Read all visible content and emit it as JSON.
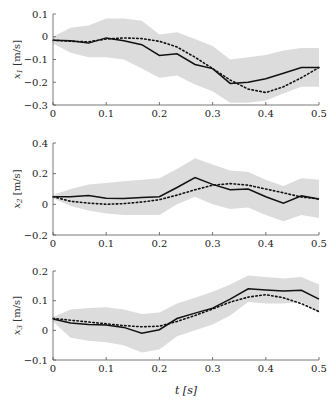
{
  "chart_data": [
    {
      "type": "line",
      "title": "",
      "xlabel": "",
      "ylabel": "x_1 [m/s]",
      "xlim": [
        0,
        0.5
      ],
      "ylim": [
        -0.3,
        0.1
      ],
      "xticks": [
        "0",
        "0.1",
        "0.2",
        "0.3",
        "0.4",
        "0.5"
      ],
      "yticks": [
        "0.1",
        "0",
        "−0.1",
        "−0.2",
        "−0.3"
      ],
      "yticks_values": [
        0.1,
        0,
        -0.1,
        -0.2,
        -0.3
      ],
      "x": [
        0,
        0.033,
        0.067,
        0.1,
        0.133,
        0.167,
        0.2,
        0.233,
        0.267,
        0.3,
        0.333,
        0.367,
        0.4,
        0.433,
        0.467,
        0.5
      ],
      "series": [
        {
          "name": "mean",
          "style": "solid",
          "values": [
            -0.015,
            -0.018,
            -0.028,
            -0.005,
            -0.018,
            -0.035,
            -0.082,
            -0.075,
            -0.122,
            -0.14,
            -0.205,
            -0.2,
            -0.185,
            -0.16,
            -0.135,
            -0.135
          ]
        },
        {
          "name": "reference",
          "style": "dotted",
          "values": [
            -0.015,
            -0.02,
            -0.022,
            -0.01,
            -0.005,
            -0.008,
            -0.02,
            -0.045,
            -0.09,
            -0.14,
            -0.19,
            -0.23,
            -0.245,
            -0.22,
            -0.18,
            -0.135
          ]
        },
        {
          "name": "upper",
          "style": "band",
          "values": [
            0.0,
            0.04,
            0.05,
            0.08,
            0.08,
            0.07,
            0.01,
            0.02,
            -0.01,
            -0.04,
            -0.1,
            -0.09,
            -0.08,
            -0.06,
            -0.05,
            -0.05
          ]
        },
        {
          "name": "lower",
          "style": "band",
          "values": [
            -0.03,
            -0.07,
            -0.09,
            -0.09,
            -0.1,
            -0.14,
            -0.18,
            -0.17,
            -0.21,
            -0.24,
            -0.29,
            -0.29,
            -0.28,
            -0.25,
            -0.22,
            -0.22
          ]
        }
      ],
      "grid": false
    },
    {
      "type": "line",
      "title": "",
      "xlabel": "",
      "ylabel": "x_2 [m/s]",
      "xlim": [
        0,
        0.5
      ],
      "ylim": [
        -0.2,
        0.4
      ],
      "xticks": [
        "0",
        "0.1",
        "0.2",
        "0.3",
        "0.4",
        "0.5"
      ],
      "yticks": [
        "0.4",
        "0.2",
        "0",
        "−0.2"
      ],
      "yticks_values": [
        0.4,
        0.2,
        0,
        -0.2
      ],
      "x": [
        0,
        0.033,
        0.067,
        0.1,
        0.133,
        0.167,
        0.2,
        0.233,
        0.267,
        0.3,
        0.333,
        0.367,
        0.4,
        0.433,
        0.467,
        0.5
      ],
      "series": [
        {
          "name": "mean",
          "style": "solid",
          "values": [
            0.05,
            0.05,
            0.058,
            0.04,
            0.038,
            0.045,
            0.05,
            0.11,
            0.175,
            0.13,
            0.095,
            0.1,
            0.05,
            0.008,
            0.055,
            0.035
          ]
        },
        {
          "name": "reference",
          "style": "dotted",
          "values": [
            0.05,
            0.02,
            0.008,
            0.0,
            0.005,
            0.015,
            0.03,
            0.06,
            0.095,
            0.125,
            0.135,
            0.125,
            0.1,
            0.075,
            0.048,
            0.035
          ]
        },
        {
          "name": "upper",
          "style": "band",
          "values": [
            0.06,
            0.1,
            0.13,
            0.14,
            0.15,
            0.16,
            0.17,
            0.23,
            0.3,
            0.26,
            0.22,
            0.21,
            0.16,
            0.12,
            0.17,
            0.16
          ]
        },
        {
          "name": "lower",
          "style": "band",
          "values": [
            0.04,
            -0.01,
            -0.04,
            -0.06,
            -0.07,
            -0.07,
            -0.07,
            0.0,
            0.05,
            0.0,
            -0.03,
            -0.02,
            -0.07,
            -0.11,
            -0.07,
            -0.09
          ]
        }
      ],
      "grid": false
    },
    {
      "type": "line",
      "title": "",
      "xlabel": "t [s]",
      "ylabel": "x_3 [m/s]",
      "xlim": [
        0,
        0.5
      ],
      "ylim": [
        -0.1,
        0.2
      ],
      "xticks": [
        "0",
        "0.1",
        "0.2",
        "0.3",
        "0.4",
        "0.5"
      ],
      "yticks": [
        "0.2",
        "0.1",
        "0",
        "−0.1"
      ],
      "yticks_values": [
        0.2,
        0.1,
        0,
        -0.1
      ],
      "x": [
        0,
        0.033,
        0.067,
        0.1,
        0.133,
        0.167,
        0.2,
        0.233,
        0.267,
        0.3,
        0.333,
        0.367,
        0.4,
        0.433,
        0.467,
        0.5
      ],
      "series": [
        {
          "name": "mean",
          "style": "solid",
          "values": [
            0.038,
            0.025,
            0.02,
            0.018,
            0.01,
            -0.01,
            0.002,
            0.04,
            0.058,
            0.075,
            0.105,
            0.14,
            0.136,
            0.133,
            0.135,
            0.105
          ]
        },
        {
          "name": "reference",
          "style": "dotted",
          "values": [
            0.04,
            0.034,
            0.028,
            0.022,
            0.016,
            0.012,
            0.014,
            0.03,
            0.05,
            0.072,
            0.095,
            0.112,
            0.12,
            0.11,
            0.09,
            0.063
          ]
        },
        {
          "name": "upper",
          "style": "band",
          "values": [
            0.045,
            0.07,
            0.075,
            0.078,
            0.07,
            0.055,
            0.06,
            0.09,
            0.11,
            0.13,
            0.155,
            0.185,
            0.18,
            0.175,
            0.18,
            0.155
          ]
        },
        {
          "name": "lower",
          "style": "band",
          "values": [
            0.03,
            -0.025,
            -0.035,
            -0.04,
            -0.05,
            -0.075,
            -0.065,
            -0.02,
            0.0,
            0.02,
            0.05,
            0.095,
            0.09,
            0.09,
            0.095,
            0.06
          ]
        }
      ],
      "grid": false
    }
  ],
  "colors": {
    "band": "#dcdcdc",
    "line": "#111111",
    "axis": "#555555"
  }
}
